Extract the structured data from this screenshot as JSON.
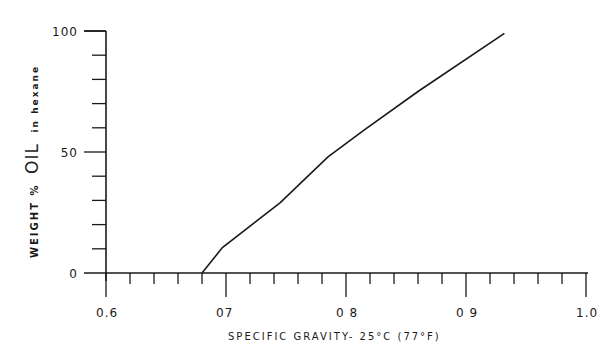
{
  "chart_data": {
    "type": "line",
    "title": "",
    "xlabel": "SPECIFIC GRAVITY- 25°C (77°F)",
    "ylabel": {
      "prefix": "WEIGHT %",
      "main": "OIL",
      "suffix": "in hexane"
    },
    "xlim": [
      0.6,
      1.0
    ],
    "ylim": [
      0,
      100
    ],
    "x_ticks": [
      0.6,
      0.7,
      0.8,
      0.9,
      1.0
    ],
    "x_tick_labels": [
      "0.6",
      "07",
      "0 8",
      "0 9",
      "1.0"
    ],
    "x_minor_step": 0.02,
    "y_ticks": [
      0,
      50,
      100
    ],
    "y_tick_labels": [
      "0",
      "50",
      "100"
    ],
    "y_minor_step": 10,
    "grid": false,
    "legend": null,
    "series": [
      {
        "name": "Weight % oil vs specific gravity",
        "x": [
          0.68,
          0.697,
          0.745,
          0.785,
          0.815,
          0.86,
          0.932
        ],
        "y": [
          0,
          10.5,
          29,
          48,
          59,
          75,
          99
        ]
      }
    ]
  }
}
